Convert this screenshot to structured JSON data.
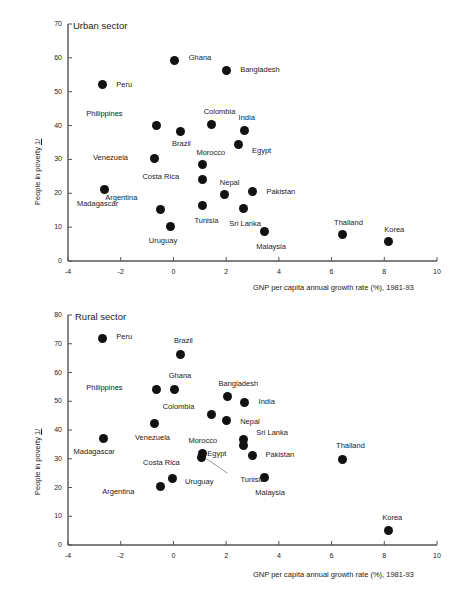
{
  "figure": {
    "axis_color": "#555555",
    "point_color": "#111111",
    "text_color": "#1a1a1a"
  },
  "chart_data": [
    {
      "type": "scatter",
      "title": "Urban sector",
      "xlabel": "GNP per capita annual growth rate (%), 1981-93",
      "ylabel": "People in poverty 1/",
      "xlim": [
        -4,
        10
      ],
      "ylim": [
        0,
        70
      ],
      "xticks": [
        "-4",
        "-2",
        "0",
        "2",
        "4",
        "6",
        "8",
        "10"
      ],
      "xtick_values": [
        -4,
        -2,
        0,
        2,
        4,
        6,
        8,
        10
      ],
      "yticks": [
        "0",
        "10",
        "20",
        "30",
        "40",
        "50",
        "60",
        "70"
      ],
      "ytick_values": [
        0,
        10,
        20,
        30,
        40,
        50,
        60,
        70
      ],
      "grid": false,
      "legend": "none",
      "points": [
        {
          "label": "Ghana",
          "x": 0.05,
          "y": 59.2,
          "lx": 14,
          "ly": -4
        },
        {
          "label": "Bangladesh",
          "x": 2.0,
          "y": 56.3,
          "lx": 14,
          "ly": -1
        },
        {
          "label": "Peru",
          "x": -2.7,
          "y": 52.0,
          "lx": 14,
          "ly": -1
        },
        {
          "label": "Philippines",
          "x": -0.65,
          "y": 40.1,
          "lx": -70,
          "ly": -12
        },
        {
          "label": "Colombia",
          "x": 1.45,
          "y": 40.3,
          "lx": -8,
          "ly": -14
        },
        {
          "label": "India",
          "x": 2.7,
          "y": 38.4,
          "lx": -6,
          "ly": -14
        },
        {
          "label": "Brazil",
          "x": 0.25,
          "y": 38.2,
          "lx": -8,
          "ly": 11
        },
        {
          "label": "Egypt",
          "x": 2.45,
          "y": 34.4,
          "lx": 14,
          "ly": 5
        },
        {
          "label": "Venezuela",
          "x": -0.7,
          "y": 30.2,
          "lx": -62,
          "ly": -2
        },
        {
          "label": "Morocco",
          "x": 1.1,
          "y": 28.5,
          "lx": -6,
          "ly": -13
        },
        {
          "label": "Costa Rica",
          "x": 1.1,
          "y": 24.2,
          "lx": -60,
          "ly": -3
        },
        {
          "label": "Madagascar",
          "x": -2.6,
          "y": 21.1,
          "lx": -28,
          "ly": 13
        },
        {
          "label": "Pakistan",
          "x": 3.0,
          "y": 20.5,
          "lx": 14,
          "ly": -1
        },
        {
          "label": "Nepal",
          "x": 1.95,
          "y": 19.5,
          "lx": -5,
          "ly": -13
        },
        {
          "label": "Argentina",
          "x": -0.5,
          "y": 15.3,
          "lx": -55,
          "ly": -12
        },
        {
          "label": "Tunisia",
          "x": 1.1,
          "y": 16.3,
          "lx": -8,
          "ly": 14
        },
        {
          "label": "Sri Lanka",
          "x": 2.65,
          "y": 15.5,
          "lx": -14,
          "ly": 14
        },
        {
          "label": "Uruguay",
          "x": -0.1,
          "y": 10.3,
          "lx": -22,
          "ly": 14
        },
        {
          "label": "Malaysia",
          "x": 3.45,
          "y": 8.6,
          "lx": -8,
          "ly": 14
        },
        {
          "label": "Thailand",
          "x": 6.4,
          "y": 7.7,
          "lx": -8,
          "ly": -13
        },
        {
          "label": "Korea",
          "x": 8.15,
          "y": 5.7,
          "lx": -4,
          "ly": -13
        }
      ]
    },
    {
      "type": "scatter",
      "title": "Rural sector",
      "xlabel": "GNP per capita annual growth rate (%), 1981-93",
      "ylabel": "People in poverty 1/",
      "xlim": [
        -4,
        10
      ],
      "ylim": [
        0,
        80
      ],
      "xticks": [
        "-4",
        "-2",
        "0",
        "2",
        "4",
        "6",
        "8",
        "10"
      ],
      "xtick_values": [
        -4,
        -2,
        0,
        2,
        4,
        6,
        8,
        10
      ],
      "yticks": [
        "0",
        "10",
        "20",
        "30",
        "40",
        "50",
        "60",
        "70",
        "80"
      ],
      "ytick_values": [
        0,
        10,
        20,
        30,
        40,
        50,
        60,
        70,
        80
      ],
      "grid": false,
      "legend": "none",
      "points": [
        {
          "label": "Peru",
          "x": -2.7,
          "y": 72.0,
          "lx": 14,
          "ly": -2
        },
        {
          "label": "Brazil",
          "x": 0.25,
          "y": 66.3,
          "lx": -6,
          "ly": -14
        },
        {
          "label": "Ghana",
          "x": 0.05,
          "y": 54.2,
          "lx": -6,
          "ly": -14
        },
        {
          "label": "Philippines",
          "x": -0.65,
          "y": 54.2,
          "lx": -70,
          "ly": -2
        },
        {
          "label": "Bangladesh",
          "x": 2.05,
          "y": 51.5,
          "lx": -9,
          "ly": -14
        },
        {
          "label": "India",
          "x": 2.7,
          "y": 49.6,
          "lx": 14,
          "ly": -1
        },
        {
          "label": "Colombia",
          "x": 1.45,
          "y": 45.3,
          "lx": -49,
          "ly": -9
        },
        {
          "label": "Nepal",
          "x": 2.0,
          "y": 43.2,
          "lx": 14,
          "ly": 0
        },
        {
          "label": "Venezuela",
          "x": -0.7,
          "y": 42.2,
          "lx": -20,
          "ly": 13
        },
        {
          "label": "Sri Lanka",
          "x": 2.65,
          "y": 36.8,
          "lx": 13,
          "ly": -7
        },
        {
          "label": "Madagascar",
          "x": -2.65,
          "y": 37.1,
          "lx": -30,
          "ly": 13
        },
        {
          "label": "Egypt",
          "x": 2.65,
          "y": 34.6,
          "lx": -36,
          "ly": 7
        },
        {
          "label": "Morocco",
          "x": 1.1,
          "y": 31.8,
          "lx": -14,
          "ly": -14
        },
        {
          "label": "Pakistan",
          "x": 3.0,
          "y": 31.3,
          "lx": 13,
          "ly": -1
        },
        {
          "label": "Costa Rica",
          "x": 1.05,
          "y": 30.5,
          "lx": -58,
          "ly": 5
        },
        {
          "label": "Thailand",
          "x": 6.4,
          "y": 29.8,
          "lx": -6,
          "ly": -14
        },
        {
          "label": "Uruguay",
          "x": -0.05,
          "y": 23.3,
          "lx": 13,
          "ly": 3
        },
        {
          "label": "Malaysia",
          "x": 3.45,
          "y": 23.4,
          "lx": -9,
          "ly": 14
        },
        {
          "label": "Tunisia",
          "x": 1.1,
          "y": 31.0,
          "lx": 38,
          "ly": 23
        },
        {
          "label": "Argentina",
          "x": -0.5,
          "y": 20.3,
          "lx": -58,
          "ly": 4
        },
        {
          "label": "Korea",
          "x": 8.15,
          "y": 4.9,
          "lx": -6,
          "ly": -14
        }
      ],
      "leader_line": {
        "from_label": "Tunisia",
        "x1": 1.25,
        "y1": 30.0,
        "x2": 2.05,
        "y2": 25.0
      }
    }
  ]
}
